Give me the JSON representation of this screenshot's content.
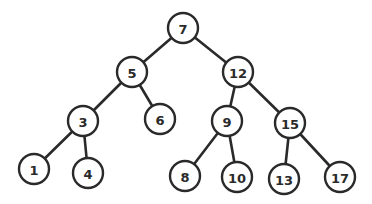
{
  "diagram": {
    "type": "binary-search-tree",
    "node_radius": 15,
    "colors": {
      "stroke": "#2a2a2a",
      "fill": "#ffffff",
      "text": "#2a2a2a"
    },
    "nodes": [
      {
        "id": "n7",
        "label": "7",
        "x": 183,
        "y": 28
      },
      {
        "id": "n5",
        "label": "5",
        "x": 132,
        "y": 72
      },
      {
        "id": "n12",
        "label": "12",
        "x": 238,
        "y": 72
      },
      {
        "id": "n3",
        "label": "3",
        "x": 83,
        "y": 121
      },
      {
        "id": "n6",
        "label": "6",
        "x": 160,
        "y": 119
      },
      {
        "id": "n9",
        "label": "9",
        "x": 227,
        "y": 121
      },
      {
        "id": "n15",
        "label": "15",
        "x": 290,
        "y": 123
      },
      {
        "id": "n1",
        "label": "1",
        "x": 34,
        "y": 169
      },
      {
        "id": "n4",
        "label": "4",
        "x": 88,
        "y": 173
      },
      {
        "id": "n8",
        "label": "8",
        "x": 185,
        "y": 176
      },
      {
        "id": "n10",
        "label": "10",
        "x": 237,
        "y": 177
      },
      {
        "id": "n13",
        "label": "13",
        "x": 284,
        "y": 179
      },
      {
        "id": "n17",
        "label": "17",
        "x": 340,
        "y": 177
      }
    ],
    "edges": [
      [
        "n7",
        "n5"
      ],
      [
        "n7",
        "n12"
      ],
      [
        "n5",
        "n3"
      ],
      [
        "n5",
        "n6"
      ],
      [
        "n12",
        "n9"
      ],
      [
        "n12",
        "n15"
      ],
      [
        "n3",
        "n1"
      ],
      [
        "n3",
        "n4"
      ],
      [
        "n9",
        "n8"
      ],
      [
        "n9",
        "n10"
      ],
      [
        "n15",
        "n13"
      ],
      [
        "n15",
        "n17"
      ]
    ]
  }
}
